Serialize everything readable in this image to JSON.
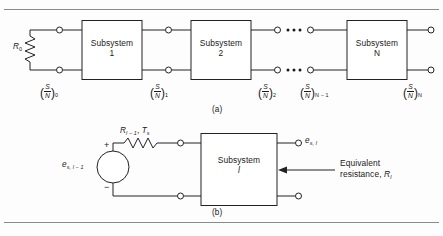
{
  "figure": {
    "panels": [
      {
        "id": "a",
        "caption": "(a)",
        "source_resistance": "R",
        "source_resistance_sub": "0",
        "blocks": [
          {
            "title": "Subsystem",
            "index": "1"
          },
          {
            "title": "Subsystem",
            "index": "2"
          },
          {
            "title": "Subsystem",
            "index": "N"
          }
        ],
        "snr_labels": [
          {
            "num": "S",
            "den": "N",
            "sub": "0"
          },
          {
            "num": "S",
            "den": "N",
            "sub": "1"
          },
          {
            "num": "S",
            "den": "N",
            "sub": "2"
          },
          {
            "num": "S",
            "den": "N",
            "sub": "N − 1"
          },
          {
            "num": "S",
            "den": "N",
            "sub": "N"
          }
        ],
        "ellipsis": "• • •"
      },
      {
        "id": "b",
        "caption": "(b)",
        "source_label": {
          "base": "e",
          "sub": "s, l − 1"
        },
        "source_plus": "+",
        "source_minus": "−",
        "resistor_label": {
          "r": "R",
          "r_sub": "l − 1",
          "sep": ", ",
          "t": "T",
          "t_sub": "s"
        },
        "block": {
          "title": "Subsystem",
          "index": "l"
        },
        "output_label": {
          "base": "e",
          "sub": "s, l"
        },
        "note": {
          "line1": "Equivalent",
          "line2": "resistance, ",
          "r": "R",
          "r_sub": "l"
        }
      }
    ]
  }
}
